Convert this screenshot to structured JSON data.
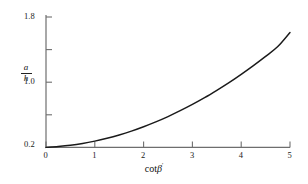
{
  "chart_data": {
    "type": "line",
    "title": "",
    "xlabel": "cotβ",
    "xlabel_parts": {
      "function": "cot",
      "variable": "β",
      "mark": "′"
    },
    "ylabel": "a/h",
    "ylabel_parts": {
      "numerator": "a",
      "denominator": "h"
    },
    "xlim": [
      0,
      5
    ],
    "ylim": [
      0.2,
      1.8
    ],
    "xticks": [
      0,
      1,
      2,
      3,
      4,
      5
    ],
    "xticklabels": [
      "0",
      "1",
      "2",
      "3",
      "4",
      "5"
    ],
    "yticks": [
      0.2,
      0.6,
      1.0,
      1.4,
      1.8
    ],
    "yticklabels": [
      "0.2",
      "",
      "1.0",
      "",
      "1.8"
    ],
    "ytick_labels_shown": [
      "0.2",
      "1.0",
      "1.8"
    ],
    "grid": false,
    "legend": null,
    "series": [
      {
        "name": "a/h vs cotβ",
        "color": "#1a1a1a",
        "x": [
          0.0,
          0.25,
          0.5,
          0.75,
          1.0,
          1.25,
          1.5,
          1.75,
          2.0,
          2.25,
          2.5,
          2.75,
          3.0,
          3.25,
          3.5,
          3.75,
          4.0,
          4.25,
          4.5,
          4.75,
          5.0
        ],
        "y": [
          0.2,
          0.211,
          0.226,
          0.248,
          0.277,
          0.312,
          0.353,
          0.4,
          0.454,
          0.513,
          0.578,
          0.65,
          0.727,
          0.81,
          0.9,
          0.995,
          1.097,
          1.204,
          1.317,
          1.437,
          1.61
        ]
      }
    ]
  },
  "axes": {
    "x_tick_labels": [
      {
        "value": "0",
        "x": 0
      },
      {
        "value": "1",
        "x": 1
      },
      {
        "value": "2",
        "x": 2
      },
      {
        "value": "3",
        "x": 3
      },
      {
        "value": "4",
        "x": 4
      },
      {
        "value": "5",
        "x": 5
      }
    ],
    "y_tick_labels": [
      {
        "value": "1.8",
        "y": 1.8
      },
      {
        "value": "1.0",
        "y": 1.0
      },
      {
        "value": "0.2",
        "y": 0.2
      }
    ]
  },
  "colors": {
    "background": "#ffffff",
    "axis": "#6e6e6e",
    "curve": "#1a1a1a",
    "text": "#111111"
  }
}
